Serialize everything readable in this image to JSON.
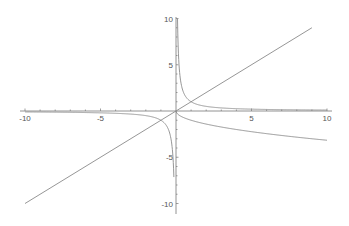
{
  "chart_data": {
    "type": "line",
    "title": "",
    "xlabel": "",
    "ylabel": "",
    "xlim": [
      -10,
      10
    ],
    "ylim": [
      -10,
      10
    ],
    "grid": false,
    "legend": null,
    "x_ticks": [
      -10,
      -5,
      5,
      10
    ],
    "y_ticks": [
      10,
      5,
      -5,
      -10
    ],
    "x_tick_labels": [
      "-10",
      "-5",
      "5",
      "10"
    ],
    "y_tick_labels": [
      "10",
      "5",
      "-5",
      "-10"
    ],
    "series": [
      {
        "name": "y = x",
        "color": "#8a8a8a",
        "x": [
          -10,
          9
        ],
        "y": [
          -10,
          9
        ]
      },
      {
        "name": "y = 1/x (x>0)",
        "color": "#8a8a8a",
        "x": [
          0.1,
          0.2,
          0.5,
          1,
          2,
          3,
          5,
          10
        ],
        "y": [
          10,
          5,
          2,
          1,
          0.5,
          0.33,
          0.2,
          0.1
        ]
      },
      {
        "name": "y = 1/x (x<0)",
        "color": "#8a8a8a",
        "x": [
          -10,
          -5,
          -3,
          -2,
          -1,
          -0.5,
          -0.2,
          -0.13
        ],
        "y": [
          -0.1,
          -0.2,
          -0.33,
          -0.5,
          -1,
          -2,
          -5,
          -7.7
        ]
      },
      {
        "name": "y = -sqrt(x)",
        "color": "#8a8a8a",
        "x": [
          0,
          1,
          2,
          4,
          6,
          8,
          10
        ],
        "y": [
          0,
          -1,
          -1.41,
          -2,
          -2.45,
          -2.83,
          -3.16
        ]
      }
    ]
  },
  "axis_color": "#777777",
  "curve_color": "#8a8a8a"
}
